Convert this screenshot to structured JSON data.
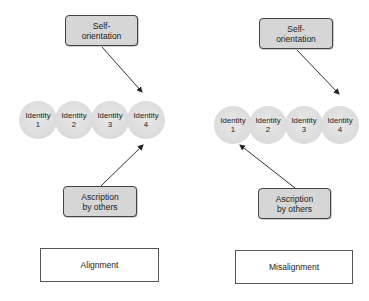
{
  "panels": [
    {
      "id": "left",
      "self_orientation": {
        "line1": "Self-",
        "line2": "orientation"
      },
      "identities": [
        {
          "word": "Identity",
          "num": "1"
        },
        {
          "word": "Identity",
          "num": "2"
        },
        {
          "word": "Identity",
          "num": "3"
        },
        {
          "word": "Identity",
          "num": "4"
        }
      ],
      "ascription": {
        "line1": "Ascription",
        "line2": "by others"
      },
      "caption": "Alignment",
      "self_orientation_target": "Identity 4",
      "ascription_target": "Identity 4"
    },
    {
      "id": "right",
      "self_orientation": {
        "line1": "Self-",
        "line2": "orientation"
      },
      "identities": [
        {
          "word": "Identity",
          "num": "1"
        },
        {
          "word": "Identity",
          "num": "2"
        },
        {
          "word": "Identity",
          "num": "3"
        },
        {
          "word": "Identity",
          "num": "4"
        }
      ],
      "ascription": {
        "line1": "Ascription",
        "line2": "by others"
      },
      "caption": "Misalignment",
      "self_orientation_target": "Identity 4",
      "ascription_target": "Identity 1"
    }
  ],
  "colors": {
    "label_box_fill": "#d6d6d6",
    "circle_fill": "#dcdcdc",
    "stroke": "#333333",
    "background": "#ffffff"
  }
}
